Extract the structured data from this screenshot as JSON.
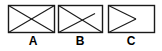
{
  "figure": {
    "type": "line-diagram",
    "background_color": "#ffffff",
    "stroke_color": "#1a1a1a",
    "label_color": "#000000",
    "canvas": {
      "width": 162,
      "height": 51
    },
    "items": [
      {
        "id": "shape-a",
        "label": "A",
        "rect": {
          "x": 8,
          "y": 5,
          "width": 47,
          "height": 28
        },
        "pattern": "both-diagonals-x",
        "lines": [
          {
            "x1": 8,
            "y1": 5,
            "x2": 55,
            "y2": 33
          },
          {
            "x1": 8,
            "y1": 33,
            "x2": 55,
            "y2": 5
          }
        ]
      },
      {
        "id": "shape-b",
        "label": "B",
        "rect": {
          "x": 58,
          "y": 5,
          "width": 45,
          "height": 28
        },
        "pattern": "diagonal-plus-right-triangle",
        "lines": [
          {
            "x1": 58,
            "y1": 5,
            "x2": 103,
            "y2": 33
          },
          {
            "x1": 58,
            "y1": 33,
            "x2": 95,
            "y2": 14
          }
        ]
      },
      {
        "id": "shape-c",
        "label": "C",
        "rect": {
          "x": 108,
          "y": 5,
          "width": 47,
          "height": 28
        },
        "pattern": "right-pointing-triangle",
        "lines": [
          {
            "x1": 108,
            "y1": 5,
            "x2": 136,
            "y2": 19
          },
          {
            "x1": 108,
            "y1": 33,
            "x2": 136,
            "y2": 19
          }
        ]
      }
    ]
  }
}
